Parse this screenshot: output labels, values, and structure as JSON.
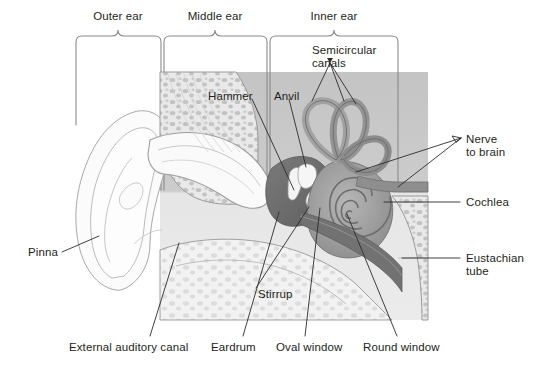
{
  "figure": {
    "colors": {
      "page_background": "#ffffff",
      "image_panel_background": "#c9c9c9",
      "image_panel_light": "#e3e3e3",
      "tissue_fill": "#efefef",
      "bone_fill": "#d8d8d8",
      "cavity_dark": "#6f6f6f",
      "cochlea_mid": "#9a9a9a",
      "outline_stroke": "#8d8d8d",
      "leader_line": "#2b2b2b",
      "bracket_stroke": "#8a8a8a",
      "text": "#231f20"
    }
  },
  "brackets": [
    {
      "id": "outer-ear",
      "label": "Outer ear",
      "x_start": 76,
      "x_end": 161,
      "label_x": 118,
      "label_y": 10
    },
    {
      "id": "middle-ear",
      "label": "Middle ear",
      "x_start": 164,
      "x_end": 267,
      "label_x": 215,
      "label_y": 10
    },
    {
      "id": "inner-ear",
      "label": "Inner ear",
      "x_start": 270,
      "x_end": 398,
      "label_x": 334,
      "label_y": 10
    }
  ],
  "labels": [
    {
      "id": "semicircular-canals",
      "text": "Semicircular\ncanals",
      "line1": "Semicircular",
      "line2": "canals",
      "x": 312,
      "y": 44,
      "align": "left"
    },
    {
      "id": "hammer",
      "text": "Hammer",
      "line1": "Hammer",
      "line2": "",
      "x": 208,
      "y": 90,
      "align": "left"
    },
    {
      "id": "anvil",
      "text": "Anvil",
      "line1": "Anvil",
      "line2": "",
      "x": 274,
      "y": 90,
      "align": "left"
    },
    {
      "id": "nerve-to-brain",
      "text": "Nerve\nto brain",
      "line1": "Nerve",
      "line2": "to brain",
      "x": 466,
      "y": 133,
      "align": "left"
    },
    {
      "id": "cochlea",
      "text": "Cochlea",
      "line1": "Cochlea",
      "line2": "",
      "x": 466,
      "y": 198,
      "align": "left"
    },
    {
      "id": "eustachian-tube",
      "text": "Eustachian\ntube",
      "line1": "Eustachian",
      "line2": "tube",
      "x": 466,
      "y": 253,
      "align": "left"
    },
    {
      "id": "pinna",
      "text": "Pinna",
      "line1": "Pinna",
      "line2": "",
      "x": 28,
      "y": 252,
      "align": "left"
    },
    {
      "id": "stirrup",
      "text": "Stirrup",
      "line1": "Stirrup",
      "line2": "",
      "x": 258,
      "y": 290,
      "align": "left"
    },
    {
      "id": "external-auditory-canal",
      "text": "External auditory canal",
      "line1": "External auditory canal",
      "line2": "",
      "x": 69,
      "y": 344,
      "align": "left"
    },
    {
      "id": "eardrum",
      "text": "Eardrum",
      "line1": "Eardrum",
      "line2": "",
      "x": 211,
      "y": 344,
      "align": "left"
    },
    {
      "id": "oval-window",
      "text": "Oval window",
      "line1": "Oval window",
      "line2": "",
      "x": 276,
      "y": 344,
      "align": "left"
    },
    {
      "id": "round-window",
      "text": "Round window",
      "line1": "Round window",
      "line2": "",
      "x": 363,
      "y": 344,
      "align": "left"
    }
  ],
  "leader_lines": [
    {
      "id": "leader-semicircular-canals",
      "from_label": "semicircular-canals",
      "points": "330,63 312,101 330,63 344,101 330,63 356,104"
    },
    {
      "id": "leader-hammer",
      "from_label": "hammer",
      "points": "252,99 294,190"
    },
    {
      "id": "leader-anvil",
      "from_label": "anvil",
      "points": "289,99 305,168"
    },
    {
      "id": "leader-nerve-to-brain",
      "from_label": "nerve-to-brain",
      "points": "462,138 356,171 462,138 394,186"
    },
    {
      "id": "leader-cochlea",
      "from_label": "cochlea",
      "points": "460,202 383,202"
    },
    {
      "id": "leader-eustachian-tube",
      "from_label": "eustachian-tube",
      "points": "460,258 402,258"
    },
    {
      "id": "leader-pinna",
      "from_label": "pinna",
      "points": "62,252 96,238"
    },
    {
      "id": "leader-stirrup",
      "from_label": "stirrup",
      "points": "256,288 309,206"
    },
    {
      "id": "leader-external-auditory-canal",
      "from_label": "external-auditory-canal",
      "points": "150,336 178,244"
    },
    {
      "id": "leader-eardrum",
      "from_label": "eardrum",
      "points": "243,336 280,210"
    },
    {
      "id": "leader-oval-window",
      "from_label": "oval-window",
      "points": "305,336 319,207"
    },
    {
      "id": "leader-round-window",
      "from_label": "round-window",
      "points": "397,336 345,211"
    }
  ],
  "regions": [
    {
      "id": "image-panel",
      "kind": "background-panel",
      "x": 160,
      "y": 72,
      "width": 268,
      "height": 248
    },
    {
      "id": "pinna-shape",
      "kind": "anatomy-outline"
    },
    {
      "id": "ear-canal",
      "kind": "anatomy-outline"
    },
    {
      "id": "skull-bone",
      "kind": "anatomy-fill"
    },
    {
      "id": "tympanic-cavity",
      "kind": "anatomy-fill"
    },
    {
      "id": "cochlea-spiral",
      "kind": "anatomy-fill"
    },
    {
      "id": "semicircular-canal-loops",
      "kind": "anatomy-fill"
    },
    {
      "id": "auditory-nerve",
      "kind": "anatomy-fill"
    },
    {
      "id": "eustachian-tube-shape",
      "kind": "anatomy-fill"
    },
    {
      "id": "ossicles-hammer",
      "kind": "anatomy-fill"
    },
    {
      "id": "ossicles-anvil",
      "kind": "anatomy-fill"
    },
    {
      "id": "ossicles-stirrup",
      "kind": "anatomy-fill"
    },
    {
      "id": "oval-window-marker",
      "kind": "anatomy-fill"
    },
    {
      "id": "round-window-marker",
      "kind": "anatomy-dot"
    }
  ]
}
